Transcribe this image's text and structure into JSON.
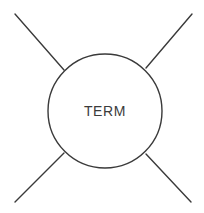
{
  "diagram": {
    "background_color": "#ffffff",
    "stroke_color": "#3a3a3a",
    "text_color": "#3b3b3b",
    "stroke_width": 1.4,
    "node": {
      "label": "TERM",
      "shape": "circle",
      "center_x": 105,
      "center_y": 111,
      "radius": 57,
      "fill": "#ffffff"
    },
    "edges": [
      {
        "name": "edge-top-left",
        "label": "",
        "x1": 15,
        "y1": 14,
        "x2": 64,
        "y2": 70
      },
      {
        "name": "edge-top-right",
        "label": "",
        "x1": 192,
        "y1": 14,
        "x2": 146,
        "y2": 68
      },
      {
        "name": "edge-bottom-left",
        "label": "",
        "x1": 15,
        "y1": 202,
        "x2": 64,
        "y2": 153
      },
      {
        "name": "edge-bottom-right",
        "label": "",
        "x1": 191,
        "y1": 202,
        "x2": 146,
        "y2": 154
      }
    ]
  }
}
